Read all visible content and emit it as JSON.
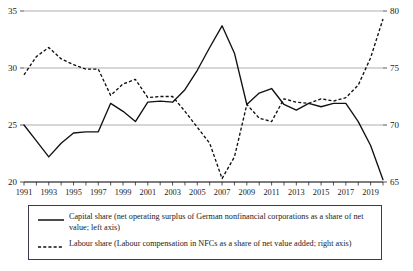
{
  "chart_data": {
    "type": "line",
    "title": "",
    "subtitle": "",
    "xlabel": "",
    "ylabel": "",
    "grid": true,
    "legend_position": "bottom",
    "x": [
      1991,
      1992,
      1993,
      1994,
      1995,
      1996,
      1997,
      1998,
      1999,
      2000,
      2001,
      2002,
      2003,
      2004,
      2005,
      2006,
      2007,
      2008,
      2009,
      2010,
      2011,
      2012,
      2013,
      2014,
      2015,
      2016,
      2017,
      2018,
      2019,
      2020
    ],
    "x_tick_labels": [
      "1991",
      "1993",
      "1995",
      "1997",
      "1999",
      "2001",
      "2003",
      "2005",
      "2007",
      "2009",
      "2011",
      "2013",
      "2015",
      "2017",
      "2019"
    ],
    "left_axis": {
      "ylim": [
        20,
        35
      ],
      "ticks": [
        20,
        25,
        30,
        35
      ],
      "tick_labels": [
        "20",
        "25",
        "30",
        "35"
      ]
    },
    "right_axis": {
      "ylim": [
        65,
        80
      ],
      "ticks": [
        65,
        70,
        75,
        80
      ],
      "tick_labels": [
        "65",
        "70",
        "75",
        "80"
      ]
    },
    "series": [
      {
        "name": "Capital share",
        "axis": "left",
        "style": "solid",
        "color": "#111111",
        "values": [
          25.0,
          23.6,
          22.2,
          23.4,
          24.3,
          24.4,
          24.4,
          26.9,
          26.2,
          25.3,
          27.0,
          27.1,
          27.0,
          28.1,
          29.8,
          31.8,
          33.7,
          31.3,
          26.8,
          27.8,
          28.2,
          26.8,
          26.3,
          26.9,
          26.6,
          26.9,
          26.9,
          25.3,
          23.2,
          20.2
        ]
      },
      {
        "name": "Labour share",
        "axis": "right",
        "style": "dashed",
        "color": "#111111",
        "values": [
          74.4,
          76.0,
          76.8,
          75.8,
          75.3,
          74.9,
          74.9,
          72.6,
          73.6,
          74.0,
          72.4,
          72.5,
          72.5,
          71.2,
          69.8,
          68.4,
          65.3,
          67.2,
          71.8,
          70.6,
          70.3,
          72.3,
          72.0,
          71.9,
          72.3,
          72.1,
          72.4,
          73.5,
          75.9,
          79.3
        ]
      }
    ]
  },
  "legend": {
    "items": [
      {
        "key_style": "solid",
        "label": "Capital share (net operating surplus of German nonfinancial corporations as a share of net value; left axis)"
      },
      {
        "key_style": "dashed",
        "label": "Labour share (Labour compensation in NFCs as a share of net value added; right axis)"
      }
    ]
  }
}
